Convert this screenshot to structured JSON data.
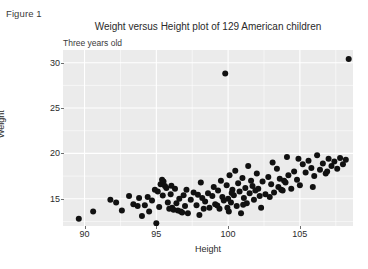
{
  "figure_caption": "Figure 1",
  "chart_data": {
    "type": "scatter",
    "title": "Weight versus Height plot of 129 American children",
    "subtitle": "Three years old",
    "xlabel": "Height",
    "ylabel": "Weight",
    "xlim": [
      88.5,
      108.7
    ],
    "ylim": [
      12.0,
      31.4
    ],
    "xticks": [
      90,
      95,
      100,
      105
    ],
    "yticks": [
      15,
      20,
      25,
      30
    ],
    "xtick_labels": [
      "90",
      "95",
      "100",
      "105"
    ],
    "ytick_labels": [
      "15",
      "20",
      "25",
      "30"
    ],
    "x_minor_ticks": [
      92.5,
      97.5,
      102.5,
      107.5
    ],
    "y_minor_ticks": [
      12.5,
      17.5,
      22.5,
      27.5
    ],
    "grid": true,
    "grid_color": "#ffffff",
    "panel_background": "#ebebeb",
    "point_color": "#111111",
    "point_size": 3.0,
    "n_points": 129,
    "legend": null,
    "points": [
      [
        89.6,
        12.8
      ],
      [
        90.6,
        13.6
      ],
      [
        91.8,
        14.9
      ],
      [
        92.6,
        13.7
      ],
      [
        93.1,
        15.3
      ],
      [
        93.4,
        14.4
      ],
      [
        93.7,
        14.2
      ],
      [
        93.8,
        15.1
      ],
      [
        94.0,
        13.1
      ],
      [
        94.2,
        14.3
      ],
      [
        94.4,
        15.2
      ],
      [
        94.5,
        13.6
      ],
      [
        94.7,
        14.8
      ],
      [
        95.0,
        12.3
      ],
      [
        95.1,
        15.8
      ],
      [
        95.2,
        14.1
      ],
      [
        95.3,
        16.6
      ],
      [
        95.4,
        17.1
      ],
      [
        95.5,
        16.9
      ],
      [
        95.6,
        16.4
      ],
      [
        95.7,
        16.2
      ],
      [
        95.8,
        14.6
      ],
      [
        95.9,
        13.9
      ],
      [
        96.0,
        15.5
      ],
      [
        96.1,
        14.0
      ],
      [
        96.2,
        13.8
      ],
      [
        96.3,
        16.1
      ],
      [
        96.4,
        14.5
      ],
      [
        96.5,
        13.7
      ],
      [
        96.6,
        15.0
      ],
      [
        96.7,
        13.6
      ],
      [
        96.8,
        13.5
      ],
      [
        96.9,
        15.4
      ],
      [
        97.0,
        14.2
      ],
      [
        97.1,
        16.0
      ],
      [
        97.2,
        13.4
      ],
      [
        97.4,
        14.9
      ],
      [
        97.6,
        15.7
      ],
      [
        97.8,
        14.3
      ],
      [
        98.0,
        13.2
      ],
      [
        98.1,
        16.8
      ],
      [
        98.2,
        15.1
      ],
      [
        98.4,
        14.7
      ],
      [
        98.6,
        15.6
      ],
      [
        98.7,
        14.0
      ],
      [
        98.9,
        15.3
      ],
      [
        99.0,
        16.3
      ],
      [
        99.1,
        14.4
      ],
      [
        99.3,
        15.9
      ],
      [
        99.4,
        13.9
      ],
      [
        99.5,
        17.0
      ],
      [
        99.6,
        15.2
      ],
      [
        99.7,
        14.8
      ],
      [
        99.8,
        28.8
      ],
      [
        99.9,
        16.5
      ],
      [
        100.0,
        15.0
      ],
      [
        100.1,
        17.6
      ],
      [
        100.2,
        14.6
      ],
      [
        100.3,
        16.0
      ],
      [
        100.4,
        15.4
      ],
      [
        100.5,
        18.1
      ],
      [
        100.6,
        14.2
      ],
      [
        100.7,
        16.7
      ],
      [
        100.8,
        15.8
      ],
      [
        100.9,
        13.4
      ],
      [
        101.0,
        17.3
      ],
      [
        101.1,
        15.1
      ],
      [
        101.2,
        16.2
      ],
      [
        101.3,
        14.5
      ],
      [
        101.4,
        18.6
      ],
      [
        101.5,
        15.6
      ],
      [
        101.6,
        17.0
      ],
      [
        101.7,
        16.4
      ],
      [
        101.8,
        14.9
      ],
      [
        101.9,
        15.9
      ],
      [
        102.0,
        17.8
      ],
      [
        102.1,
        16.1
      ],
      [
        102.2,
        15.3
      ],
      [
        102.4,
        16.9
      ],
      [
        102.6,
        15.5
      ],
      [
        102.8,
        17.4
      ],
      [
        103.0,
        16.6
      ],
      [
        103.1,
        19.0
      ],
      [
        103.2,
        15.7
      ],
      [
        103.4,
        18.3
      ],
      [
        103.5,
        16.3
      ],
      [
        103.6,
        17.2
      ],
      [
        103.8,
        15.9
      ],
      [
        104.0,
        16.8
      ],
      [
        104.1,
        19.6
      ],
      [
        104.2,
        17.6
      ],
      [
        104.4,
        16.1
      ],
      [
        104.6,
        18.0
      ],
      [
        104.8,
        17.1
      ],
      [
        105.0,
        16.5
      ],
      [
        105.2,
        18.8
      ],
      [
        105.4,
        17.9
      ],
      [
        105.6,
        19.2
      ],
      [
        105.8,
        18.4
      ],
      [
        106.0,
        17.5
      ],
      [
        106.2,
        19.8
      ],
      [
        106.4,
        18.2
      ],
      [
        106.6,
        18.9
      ],
      [
        106.8,
        17.8
      ],
      [
        107.0,
        19.4
      ],
      [
        107.2,
        18.6
      ],
      [
        107.4,
        19.1
      ],
      [
        107.6,
        18.3
      ],
      [
        107.8,
        19.5
      ],
      [
        108.0,
        18.8
      ],
      [
        108.2,
        19.3
      ],
      [
        108.4,
        30.4
      ],
      [
        92.2,
        14.6
      ],
      [
        96.05,
        16.45
      ],
      [
        97.9,
        15.45
      ],
      [
        99.25,
        14.25
      ],
      [
        100.25,
        15.65
      ],
      [
        101.05,
        14.35
      ],
      [
        102.3,
        14.0
      ],
      [
        103.7,
        16.0
      ],
      [
        104.9,
        19.4
      ],
      [
        105.9,
        16.3
      ],
      [
        98.3,
        13.9
      ],
      [
        99.95,
        14.0
      ],
      [
        95.45,
        15.35
      ],
      [
        94.9,
        16.0
      ],
      [
        102.9,
        15.2
      ],
      [
        106.9,
        18.0
      ],
      [
        103.9,
        17.0
      ],
      [
        100.05,
        13.6
      ]
    ]
  }
}
